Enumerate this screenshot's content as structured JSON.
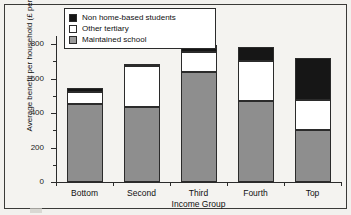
{
  "chart_data": {
    "type": "bar",
    "stacked": true,
    "title": "",
    "xlabel": "Income Group",
    "ylabel": "Average benefit per household (£ per year)",
    "categories": [
      "Bottom",
      "Second",
      "Third",
      "Fourth",
      "Top"
    ],
    "ylim": [
      0,
      860
    ],
    "yticks": [
      0,
      200,
      400,
      600,
      800
    ],
    "ytick_labels": [
      "0",
      "200",
      "400",
      "600",
      "800"
    ],
    "minor_ticks": [
      100,
      300,
      500,
      700
    ],
    "grid": false,
    "legend_position": "top-left",
    "series": [
      {
        "name": "Maintained school",
        "color": "#8e8e8e",
        "values": [
          455,
          435,
          638,
          472,
          301
        ]
      },
      {
        "name": "Other tertiary",
        "color": "#ffffff",
        "values": [
          65,
          235,
          116,
          228,
          174
        ]
      },
      {
        "name": "Non home-based students",
        "color": "#161616",
        "values": [
          25,
          15,
          40,
          85,
          244
        ]
      }
    ],
    "totals": [
      545,
      685,
      794,
      785,
      719
    ]
  },
  "legend": {
    "items": [
      {
        "label": "Non home-based students",
        "swatch": "nonhome"
      },
      {
        "label": "Other tertiary",
        "swatch": "tertiary"
      },
      {
        "label": "Maintained school",
        "swatch": "school"
      }
    ]
  }
}
